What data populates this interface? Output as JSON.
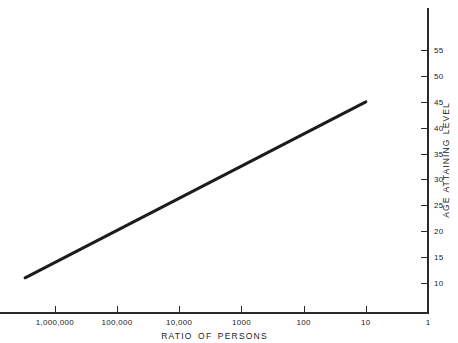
{
  "chart_data": {
    "type": "line",
    "title": "",
    "subtitle": "",
    "xlabel": "RATIO OF PERSONS",
    "ylabel": "AGE ATTAINING LEVEL",
    "x_scale": "log-reversed",
    "y_scale": "linear",
    "xlim": [
      3000000,
      1
    ],
    "ylim": [
      8,
      58
    ],
    "grid": false,
    "legend": null,
    "x_ticks": [
      {
        "value": 1000000,
        "label": "1,000,000"
      },
      {
        "value": 100000,
        "label": "100,000"
      },
      {
        "value": 10000,
        "label": "10,000"
      },
      {
        "value": 1000,
        "label": "1000"
      },
      {
        "value": 100,
        "label": "100"
      },
      {
        "value": 10,
        "label": "10"
      },
      {
        "value": 1,
        "label": "1"
      }
    ],
    "y_ticks": [
      {
        "value": 55,
        "label": "55"
      },
      {
        "value": 50,
        "label": "50"
      },
      {
        "value": 45,
        "label": "45"
      },
      {
        "value": 40,
        "label": "40"
      },
      {
        "value": 35,
        "label": "35"
      },
      {
        "value": 30,
        "label": "30"
      },
      {
        "value": 25,
        "label": "25"
      },
      {
        "value": 20,
        "label": "20"
      },
      {
        "value": 15,
        "label": "15"
      },
      {
        "value": 10,
        "label": "10"
      }
    ],
    "series": [
      {
        "name": "age attaining level",
        "color": "#1c1c1c",
        "line_width": 3,
        "points": [
          {
            "x": 3000000,
            "y": 11.0
          },
          {
            "x": 10,
            "y": 45.0
          }
        ]
      }
    ]
  },
  "axes": {
    "x_axis_color": "#2a2a2a",
    "y_axis_color": "#2a2a2a",
    "background": "#ffffff"
  }
}
